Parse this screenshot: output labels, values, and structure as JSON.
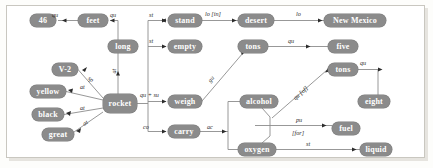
{
  "diagram": {
    "style": {
      "node_fill": "#8b8b8b",
      "node_text": "#ffffff",
      "edge_color": "#8c8c8c",
      "label_text": "#2b2b2b",
      "frame_border": "#c9c7c0",
      "page_background": "#ffffff"
    },
    "nodes": [
      {
        "id": "n46",
        "label": "46",
        "x": 30,
        "y": 14,
        "w": 26,
        "h": 13
      },
      {
        "id": "feet",
        "label": "feet",
        "x": 78,
        "y": 14,
        "w": 30,
        "h": 13
      },
      {
        "id": "long",
        "label": "long",
        "x": 108,
        "y": 40,
        "w": 30,
        "h": 13
      },
      {
        "id": "stand",
        "label": "stand",
        "x": 168,
        "y": 14,
        "w": 34,
        "h": 13
      },
      {
        "id": "desert",
        "label": "desert",
        "x": 238,
        "y": 14,
        "w": 36,
        "h": 13
      },
      {
        "id": "newmexico",
        "label": "New Mexico",
        "x": 324,
        "y": 14,
        "w": 62,
        "h": 13
      },
      {
        "id": "empty",
        "label": "empty",
        "x": 168,
        "y": 40,
        "w": 34,
        "h": 13
      },
      {
        "id": "tons_top",
        "label": "tons",
        "x": 238,
        "y": 40,
        "w": 30,
        "h": 13
      },
      {
        "id": "five",
        "label": "five",
        "x": 328,
        "y": 40,
        "w": 30,
        "h": 13
      },
      {
        "id": "v2",
        "label": "V-2",
        "x": 52,
        "y": 63,
        "w": 26,
        "h": 13
      },
      {
        "id": "yellow",
        "label": "yellow",
        "x": 30,
        "y": 85,
        "w": 36,
        "h": 13
      },
      {
        "id": "black",
        "label": "black",
        "x": 32,
        "y": 108,
        "w": 32,
        "h": 13
      },
      {
        "id": "great",
        "label": "great",
        "x": 42,
        "y": 128,
        "w": 32,
        "h": 13
      },
      {
        "id": "rocket",
        "label": "rocket",
        "x": 103,
        "y": 94,
        "w": 34,
        "h": 19
      },
      {
        "id": "weigh",
        "label": "weigh",
        "x": 168,
        "y": 95,
        "w": 34,
        "h": 13
      },
      {
        "id": "carry",
        "label": "carry",
        "x": 168,
        "y": 125,
        "w": 32,
        "h": 13
      },
      {
        "id": "alcohol",
        "label": "alcohol",
        "x": 240,
        "y": 95,
        "w": 38,
        "h": 13
      },
      {
        "id": "oxygen",
        "label": "oxygen",
        "x": 238,
        "y": 143,
        "w": 38,
        "h": 13
      },
      {
        "id": "tons_right",
        "label": "tons",
        "x": 328,
        "y": 63,
        "w": 30,
        "h": 13
      },
      {
        "id": "eight",
        "label": "eight",
        "x": 358,
        "y": 95,
        "w": 32,
        "h": 13
      },
      {
        "id": "fuel",
        "label": "fuel",
        "x": 332,
        "y": 122,
        "w": 28,
        "h": 13
      },
      {
        "id": "liquid",
        "label": "liquid",
        "x": 360,
        "y": 143,
        "w": 32,
        "h": 13
      }
    ],
    "edge_labels": [
      {
        "id": "l_feet_46",
        "text": "qu",
        "x": 52,
        "y": 12
      },
      {
        "id": "l_long_feet",
        "text": "qu",
        "x": 110,
        "y": 12
      },
      {
        "id": "l_rocket_long",
        "text": "at",
        "x": 115,
        "y": 70,
        "rotated": true
      },
      {
        "id": "l_stand",
        "text": "st",
        "x": 149,
        "y": 12
      },
      {
        "id": "l_empty",
        "text": "st",
        "x": 149,
        "y": 38
      },
      {
        "id": "l_stand_desert",
        "text": "lo [in]",
        "x": 206,
        "y": 10
      },
      {
        "id": "l_desert_nm",
        "text": "lo",
        "x": 296,
        "y": 10
      },
      {
        "id": "l_tons_five",
        "text": "qu",
        "x": 288,
        "y": 38
      },
      {
        "id": "l_v2",
        "text": "sp",
        "x": 90,
        "y": 74,
        "rotated": true
      },
      {
        "id": "l_yellow",
        "text": "at",
        "x": 79,
        "y": 84
      },
      {
        "id": "l_black",
        "text": "at",
        "x": 80,
        "y": 104
      },
      {
        "id": "l_great",
        "text": "at",
        "x": 82,
        "y": 120,
        "rotated": true
      },
      {
        "id": "l_rocket_weigh",
        "text": "qu + su",
        "x": 141,
        "y": 92
      },
      {
        "id": "l_weigh_tons",
        "text": "gu",
        "x": 211,
        "y": 76,
        "rotated": true
      },
      {
        "id": "l_rocket_carry",
        "text": "co",
        "x": 143,
        "y": 124
      },
      {
        "id": "l_carry_mix",
        "text": "ac",
        "x": 208,
        "y": 124
      },
      {
        "id": "l_mix_tons",
        "text": "qu [of]",
        "x": 300,
        "y": 88,
        "rotated": true
      },
      {
        "id": "l_fuel_top",
        "text": "pu",
        "x": 296,
        "y": 118
      },
      {
        "id": "l_fuel_bottom",
        "text": "[for]",
        "x": 294,
        "y": 130
      },
      {
        "id": "l_oxygen_liquid",
        "text": "st",
        "x": 306,
        "y": 141
      },
      {
        "id": "l_tons_eight",
        "text": "qu",
        "x": 360,
        "y": 61
      }
    ],
    "edges": [
      {
        "from": "feet",
        "to": "n46",
        "label": "qu"
      },
      {
        "from": "long",
        "to": "feet",
        "label": "qu"
      },
      {
        "from": "rocket",
        "to": "long",
        "label": "at"
      },
      {
        "from": "rocket",
        "to": "stand",
        "label": "st"
      },
      {
        "from": "rocket",
        "to": "empty",
        "label": "st"
      },
      {
        "from": "stand",
        "to": "desert",
        "label": "lo [in]"
      },
      {
        "from": "desert",
        "to": "newmexico",
        "label": "lo"
      },
      {
        "from": "tons_top",
        "to": "five",
        "label": "qu"
      },
      {
        "from": "rocket",
        "to": "v2",
        "label": "sp"
      },
      {
        "from": "rocket",
        "to": "yellow",
        "label": "at"
      },
      {
        "from": "rocket",
        "to": "black",
        "label": "at"
      },
      {
        "from": "rocket",
        "to": "great",
        "label": "at"
      },
      {
        "from": "rocket",
        "to": "weigh",
        "label": "qu + su"
      },
      {
        "from": "weigh",
        "to": "tons_top",
        "label": "gu"
      },
      {
        "from": "rocket",
        "to": "carry",
        "label": "co"
      },
      {
        "from": "carry",
        "to": "alcohol",
        "label": "ac"
      },
      {
        "from": "carry",
        "to": "oxygen",
        "label": "ac"
      },
      {
        "from": "alcohol",
        "to": "tons_right",
        "label": "qu [of]"
      },
      {
        "from": "alcohol",
        "to": "fuel",
        "label": "pu [for]"
      },
      {
        "from": "oxygen",
        "to": "liquid",
        "label": "st"
      },
      {
        "from": "tons_right",
        "to": "eight",
        "label": "qu"
      }
    ]
  }
}
